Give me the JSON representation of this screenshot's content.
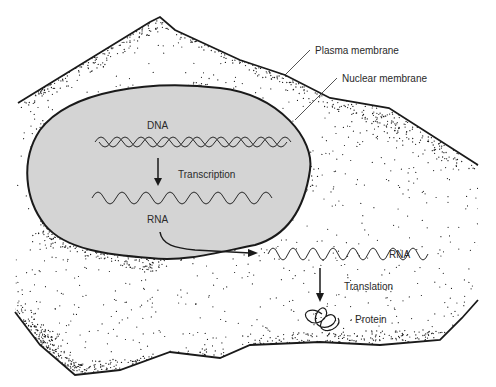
{
  "diagram": {
    "colors": {
      "background": "#ffffff",
      "nucleus_fill": "#d4d4d4",
      "outline": "#1a1a1a",
      "stipple": "#1a1a1a",
      "text": "#2a2a2a"
    },
    "labels": {
      "plasma_membrane": "Plasma membrane",
      "nuclear_membrane": "Nuclear membrane",
      "dna": "DNA",
      "transcription": "Transcription",
      "rna_nucleus": "RNA",
      "rna_cytoplasm": "RNA",
      "translation": "Translation",
      "protein": "Protein"
    },
    "flow": [
      {
        "from": "DNA",
        "to": "RNA",
        "process": "Transcription",
        "location": "nucleus"
      },
      {
        "from": "RNA",
        "to": "RNA",
        "process": "export",
        "location": "nucleus to cytoplasm"
      },
      {
        "from": "RNA",
        "to": "Protein",
        "process": "Translation",
        "location": "cytoplasm"
      }
    ]
  }
}
